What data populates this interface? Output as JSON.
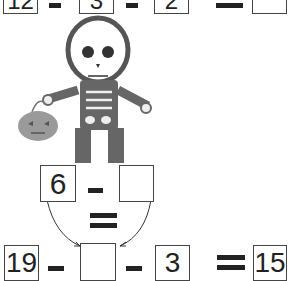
{
  "worksheet": {
    "row1": {
      "a": "12",
      "b": "3",
      "c": "2",
      "result": ""
    },
    "middle": {
      "a": "6",
      "b": ""
    },
    "row2": {
      "a": "19",
      "b": "",
      "c": "3",
      "result": "15"
    }
  },
  "illustration": {
    "subject": "skeleton holding jack-o-lantern pumpkin",
    "pumpkin_color": "#9a9a9a"
  }
}
